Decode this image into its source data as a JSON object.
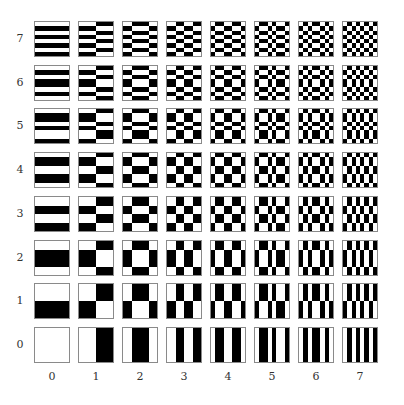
{
  "row_labels": [
    "0",
    "1",
    "2",
    "3",
    "4",
    "5",
    "6",
    "7"
  ],
  "col_labels": [
    "0",
    "1",
    "2",
    "3",
    "4",
    "5",
    "6",
    "7"
  ],
  "patterns_1d": [
    "00000000",
    "00001111",
    "00111100",
    "00110011",
    "01100110",
    "01101001",
    "01011010",
    "01010101"
  ],
  "colors": {
    "black": "#000000",
    "white": "#ffffff",
    "border": "#8a8a8a"
  },
  "layout": {
    "x0": 34,
    "dx": 44,
    "y_row7": 21,
    "dy": 43.7,
    "size": 36
  }
}
